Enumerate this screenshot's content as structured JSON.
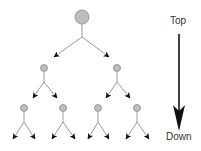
{
  "diagram": {
    "type": "tree",
    "direction_labels": {
      "top": "Top",
      "bottom": "Down"
    },
    "colors": {
      "node_fill": "#bdbdbd",
      "node_stroke": "#8a8a8a",
      "edge": "#9a9a9a",
      "arrowhead": "#111111",
      "big_arrow": "#111111",
      "text": "#333333"
    },
    "nodes": [
      {
        "id": "root",
        "level": 1,
        "x": 82,
        "y": 17,
        "r": 7
      },
      {
        "id": "l2a",
        "level": 2,
        "x": 44,
        "y": 68,
        "r": 3.5
      },
      {
        "id": "l2b",
        "level": 2,
        "x": 117,
        "y": 68,
        "r": 3.5
      },
      {
        "id": "l3a",
        "level": 3,
        "x": 24,
        "y": 108,
        "r": 3.5
      },
      {
        "id": "l3b",
        "level": 3,
        "x": 63,
        "y": 108,
        "r": 3.5
      },
      {
        "id": "l3c",
        "level": 3,
        "x": 98,
        "y": 108,
        "r": 3.5
      },
      {
        "id": "l3d",
        "level": 3,
        "x": 137,
        "y": 108,
        "r": 3.5
      }
    ],
    "edges": [
      {
        "from": "root",
        "stem": [
          82,
          24,
          82,
          37
        ],
        "branches": [
          [
            54,
            57
          ],
          [
            109,
            57
          ]
        ]
      },
      {
        "from": "l2a",
        "stem": [
          44,
          72,
          44,
          82
        ],
        "branches": [
          [
            33,
            98
          ],
          [
            57,
            98
          ]
        ]
      },
      {
        "from": "l2b",
        "stem": [
          117,
          72,
          117,
          82
        ],
        "branches": [
          [
            106,
            98
          ],
          [
            130,
            98
          ]
        ]
      },
      {
        "from": "l3a",
        "stem": [
          24,
          112,
          24,
          122
        ],
        "branches": [
          [
            13,
            139
          ],
          [
            35,
            139
          ]
        ]
      },
      {
        "from": "l3b",
        "stem": [
          63,
          112,
          63,
          122
        ],
        "branches": [
          [
            52,
            139
          ],
          [
            75,
            139
          ]
        ]
      },
      {
        "from": "l3c",
        "stem": [
          98,
          112,
          98,
          122
        ],
        "branches": [
          [
            88,
            139
          ],
          [
            109,
            139
          ]
        ]
      },
      {
        "from": "l3d",
        "stem": [
          137,
          112,
          137,
          122
        ],
        "branches": [
          [
            126,
            139
          ],
          [
            149,
            139
          ]
        ]
      }
    ],
    "big_arrow": {
      "x": 179,
      "y1": 34,
      "y2": 131
    }
  }
}
